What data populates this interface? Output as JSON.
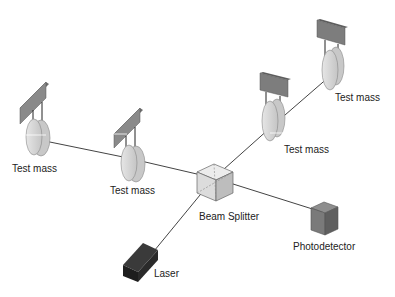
{
  "diagram": {
    "components": {
      "test_mass_left_far": {
        "label": "Test mass"
      },
      "test_mass_left_near": {
        "label": "Test mass"
      },
      "test_mass_right_near": {
        "label": "Test mass"
      },
      "test_mass_right_far": {
        "label": "Test mass"
      },
      "beam_splitter": {
        "label": "Beam Splitter"
      },
      "photodetector": {
        "label": "Photodetector"
      },
      "laser": {
        "label": "Laser"
      }
    },
    "connections": [
      {
        "from": "laser",
        "to": "beam_splitter"
      },
      {
        "from": "beam_splitter",
        "to": "test_mass_left_near"
      },
      {
        "from": "test_mass_left_near",
        "to": "test_mass_left_far"
      },
      {
        "from": "beam_splitter",
        "to": "test_mass_right_near"
      },
      {
        "from": "test_mass_right_near",
        "to": "test_mass_right_far"
      },
      {
        "from": "beam_splitter",
        "to": "photodetector"
      }
    ],
    "colors": {
      "mirror_fill": "#d4d4d4",
      "mirror_edge": "#bcbcbc",
      "support_bar": "#7a7a7a",
      "beam_splitter": "#e2e2e2",
      "photodetector": "#777777",
      "laser": "#2a2a2a",
      "beam": "#444444"
    }
  }
}
